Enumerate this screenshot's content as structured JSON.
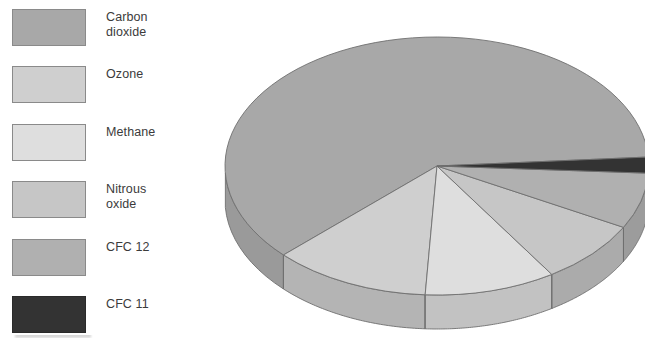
{
  "figure": {
    "kind": "3d-exploded-pie-chart",
    "background": "#ffffff"
  },
  "legend": {
    "position": "left",
    "items": [
      {
        "label": "Carbon\ndioxide",
        "plain_label": "Carbon dioxide",
        "color": "#a8a8a8",
        "border": "#8a8a8a"
      },
      {
        "label": "Ozone",
        "plain_label": "Ozone",
        "color": "#cfcfcf",
        "border": "#8a8a8a"
      },
      {
        "label": "Methane",
        "plain_label": "Methane",
        "color": "#dedede",
        "border": "#8a8a8a"
      },
      {
        "label": "Nitrous\noxide",
        "plain_label": "Nitrous oxide",
        "color": "#c6c6c6",
        "border": "#8a8a8a"
      },
      {
        "label": "CFC 12",
        "plain_label": "CFC 12",
        "color": "#b0b0b0",
        "border": "#8a8a8a"
      },
      {
        "label": "CFC 11",
        "plain_label": "CFC 11",
        "color": "#333333",
        "border": "#2a2a2a"
      }
    ]
  },
  "chart_data": {
    "type": "pie",
    "title": "",
    "subtitle": "",
    "xlabel": "",
    "ylabel": "",
    "style": "3d",
    "grid": false,
    "legend_position": "left",
    "categories": [
      "Carbon dioxide",
      "Ozone",
      "Methane",
      "Nitrous oxide",
      "CFC 12",
      "CFC 11"
    ],
    "values": [
      61,
      12,
      10,
      8,
      7,
      2
    ],
    "unit": "percent",
    "slices": [
      {
        "name": "Carbon dioxide",
        "value": 61,
        "color": "#a8a8a8",
        "side_color": "#9a9a9a"
      },
      {
        "name": "Ozone",
        "value": 12,
        "color": "#cfcfcf",
        "side_color": "#b4b4b4"
      },
      {
        "name": "Methane",
        "value": 10,
        "color": "#dedede",
        "side_color": "#c2c2c2"
      },
      {
        "name": "Nitrous oxide",
        "value": 8,
        "color": "#c6c6c6",
        "side_color": "#ababab"
      },
      {
        "name": "CFC 12",
        "value": 7,
        "color": "#b0b0b0",
        "side_color": "#9c9c9c"
      },
      {
        "name": "CFC 11",
        "value": 2,
        "color": "#333333",
        "side_color": "#2b2b2b"
      }
    ],
    "geometry": {
      "center_x": 222,
      "center_y": 166,
      "radius_x": 212,
      "radius_y": 129,
      "depth": 34,
      "start_angle_deg": -4,
      "direction": "counterclockwise"
    },
    "edge_color": "#6f6f6f"
  }
}
